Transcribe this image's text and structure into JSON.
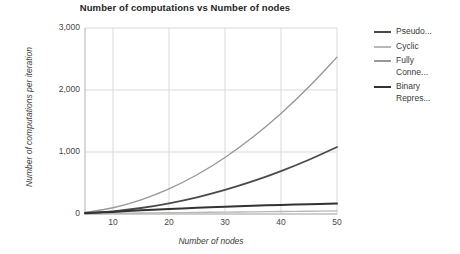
{
  "chart_data": {
    "type": "line",
    "title": "Number of computations vs Number of nodes",
    "xlabel": "Number of nodes",
    "ylabel": "Number of computations per iteration",
    "xlim": [
      5,
      50
    ],
    "ylim": [
      0,
      3000
    ],
    "grid": true,
    "legend_position": "right",
    "x_ticks": [
      "10",
      "20",
      "30",
      "40",
      "50"
    ],
    "x_tick_values": [
      10,
      20,
      30,
      40,
      50
    ],
    "y_ticks": [
      "0",
      "1,000",
      "2,000",
      "3,000"
    ],
    "y_tick_values": [
      0,
      1000,
      2000,
      3000
    ],
    "x": [
      5,
      10,
      15,
      20,
      25,
      30,
      35,
      40,
      45,
      50
    ],
    "series": [
      {
        "name": "Pseudo...",
        "full_name": "Pseudo...",
        "color": "#4a4a4a",
        "width": 1.8,
        "values": [
          11,
          43,
          97,
          173,
          270,
          389,
          529,
          692,
          875,
          1080
        ]
      },
      {
        "name": "Cyclic",
        "full_name": "Cyclic",
        "color": "#b8b8b8",
        "width": 1.4,
        "values": [
          5,
          10,
          15,
          20,
          25,
          30,
          35,
          40,
          45,
          50
        ]
      },
      {
        "name": "Fully\nConne...",
        "full_name": "Fully Conne...",
        "color": "#989898",
        "width": 1.4,
        "values": [
          25,
          101,
          228,
          405,
          633,
          912,
          1241,
          1621,
          2051,
          2530
        ]
      },
      {
        "name": "Binary\nRepres...",
        "full_name": "Binary Repres...",
        "color": "#333333",
        "width": 2.0,
        "values": [
          15,
          34,
          59,
          80,
          100,
          118,
          133,
          147,
          159,
          170
        ]
      }
    ]
  },
  "axes": {
    "grid_color": "#d9d9d9",
    "axis_color": "#b0b0b0",
    "background": "#ffffff"
  }
}
